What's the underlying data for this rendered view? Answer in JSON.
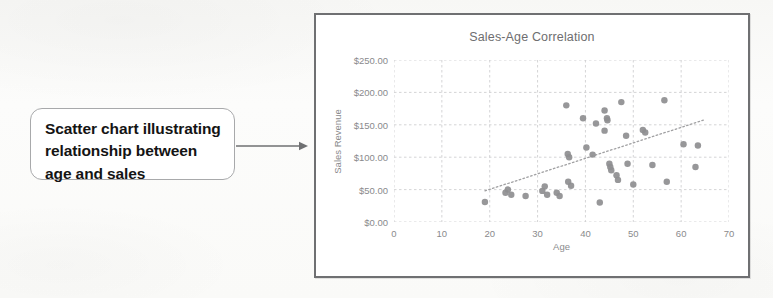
{
  "callout": {
    "text": "Scatter chart illustrating relationship between age and sales",
    "arrow_icon": "arrow-right-icon",
    "border_color": "#a8a9ab",
    "fill_color": "#ffffff"
  },
  "chart_data": {
    "type": "scatter",
    "title": "Sales-Age Correlation",
    "xlabel": "Age",
    "ylabel": "Sales Revenue",
    "xlim": [
      0,
      70
    ],
    "ylim": [
      0,
      250
    ],
    "xticks": [
      0,
      10,
      20,
      30,
      40,
      50,
      60,
      70
    ],
    "yticks": [
      0,
      50,
      100,
      150,
      200,
      250
    ],
    "xtick_labels": [
      "0",
      "10",
      "20",
      "30",
      "40",
      "50",
      "60",
      "70"
    ],
    "ytick_labels": [
      "$0.00",
      "$50.00",
      "$100.00",
      "$150.00",
      "$200.00",
      "$250.00"
    ],
    "grid": true,
    "legend": false,
    "marker_color": "#8e8e90",
    "marker_size": 5,
    "trendline": {
      "visible": true,
      "style": "dotted",
      "color": "#a0a0a2",
      "x": [
        19,
        65
      ],
      "y": [
        48,
        158
      ]
    },
    "points": [
      {
        "x": 19.0,
        "y": 31
      },
      {
        "x": 23.3,
        "y": 45
      },
      {
        "x": 23.8,
        "y": 50
      },
      {
        "x": 24.5,
        "y": 42
      },
      {
        "x": 27.5,
        "y": 40
      },
      {
        "x": 31.0,
        "y": 48
      },
      {
        "x": 31.5,
        "y": 55
      },
      {
        "x": 32.0,
        "y": 42
      },
      {
        "x": 34.0,
        "y": 45
      },
      {
        "x": 34.6,
        "y": 40
      },
      {
        "x": 36.0,
        "y": 180
      },
      {
        "x": 36.3,
        "y": 105
      },
      {
        "x": 36.6,
        "y": 100
      },
      {
        "x": 36.4,
        "y": 62
      },
      {
        "x": 37.0,
        "y": 56
      },
      {
        "x": 39.5,
        "y": 160
      },
      {
        "x": 40.2,
        "y": 115
      },
      {
        "x": 41.5,
        "y": 104
      },
      {
        "x": 42.2,
        "y": 152
      },
      {
        "x": 43.0,
        "y": 30
      },
      {
        "x": 44.0,
        "y": 172
      },
      {
        "x": 44.5,
        "y": 160
      },
      {
        "x": 44.6,
        "y": 157
      },
      {
        "x": 45.0,
        "y": 90
      },
      {
        "x": 45.2,
        "y": 85
      },
      {
        "x": 45.4,
        "y": 80
      },
      {
        "x": 44.0,
        "y": 141
      },
      {
        "x": 46.5,
        "y": 72
      },
      {
        "x": 46.8,
        "y": 65
      },
      {
        "x": 47.5,
        "y": 185
      },
      {
        "x": 48.5,
        "y": 133
      },
      {
        "x": 48.8,
        "y": 90
      },
      {
        "x": 50.0,
        "y": 58
      },
      {
        "x": 52.0,
        "y": 142
      },
      {
        "x": 52.5,
        "y": 138
      },
      {
        "x": 54.0,
        "y": 88
      },
      {
        "x": 56.5,
        "y": 188
      },
      {
        "x": 57.0,
        "y": 62
      },
      {
        "x": 60.5,
        "y": 120
      },
      {
        "x": 63.0,
        "y": 85
      },
      {
        "x": 63.5,
        "y": 118
      }
    ]
  }
}
